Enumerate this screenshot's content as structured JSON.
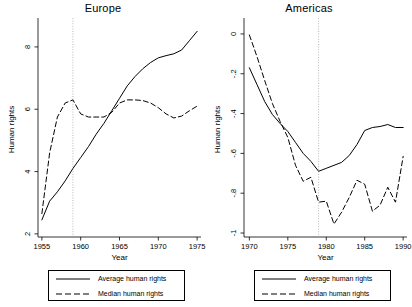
{
  "figure": {
    "axis_label_x": "Year",
    "axis_label_y": "Human rights"
  },
  "legend": {
    "average_label": "Average human rights",
    "median_label": "Median human rights",
    "average_style": "solid",
    "median_style": "dashed",
    "line_color": "#000000"
  },
  "chart_data": [
    {
      "type": "line",
      "title": "Europe",
      "xlabel": "Year",
      "ylabel": "Human rights",
      "xlim": [
        1954.5,
        1975.5
      ],
      "ylim": [
        1.9,
        8.8
      ],
      "xticks": [
        1955,
        1960,
        1965,
        1970,
        1975
      ],
      "xticklabels": [
        "1955",
        "1960",
        "1965",
        "1970",
        "1975"
      ],
      "yticks": [
        2,
        4,
        6,
        8
      ],
      "yticklabels": [
        "2",
        "4",
        "6",
        "8"
      ],
      "grid": false,
      "reference_line_x": 1959,
      "legend_position": "below",
      "x": [
        1955,
        1956,
        1957,
        1958,
        1959,
        1960,
        1961,
        1962,
        1963,
        1964,
        1965,
        1966,
        1967,
        1968,
        1969,
        1970,
        1971,
        1972,
        1973,
        1974,
        1975
      ],
      "series": [
        {
          "name": "Average human rights",
          "style": "solid",
          "values": [
            2.45,
            3.05,
            3.35,
            3.7,
            4.1,
            4.45,
            4.8,
            5.2,
            5.55,
            5.95,
            6.35,
            6.75,
            7.05,
            7.3,
            7.5,
            7.65,
            7.72,
            7.78,
            7.9,
            8.2,
            8.5
          ]
        },
        {
          "name": "Median human rights",
          "style": "dashed",
          "values": [
            2.65,
            4.6,
            5.75,
            6.2,
            6.3,
            5.85,
            5.75,
            5.75,
            5.75,
            5.9,
            6.2,
            6.3,
            6.3,
            6.28,
            6.2,
            6.05,
            5.85,
            5.72,
            5.78,
            5.95,
            6.1
          ]
        }
      ]
    },
    {
      "type": "line",
      "title": "Americas",
      "xlabel": "Year",
      "ylabel": "Human rights",
      "xlim": [
        1969.3,
        1990.5
      ],
      "ylim": [
        -1.02,
        0.06
      ],
      "xticks": [
        1970,
        1975,
        1980,
        1985,
        1990
      ],
      "xticklabels": [
        "1970",
        "1975",
        "1980",
        "1985",
        "1990"
      ],
      "yticks": [
        0,
        -0.2,
        -0.4,
        -0.6,
        -0.8,
        -1
      ],
      "yticklabels": [
        "0",
        "-.2",
        "-.4",
        "-.6",
        "-.8",
        "-1"
      ],
      "grid": false,
      "reference_line_x": 1979,
      "legend_position": "below",
      "x": [
        1970,
        1971,
        1972,
        1973,
        1974,
        1975,
        1976,
        1977,
        1978,
        1979,
        1980,
        1981,
        1982,
        1983,
        1984,
        1985,
        1986,
        1987,
        1988,
        1989,
        1990
      ],
      "series": [
        {
          "name": "Average human rights",
          "style": "solid",
          "values": [
            -0.17,
            -0.255,
            -0.34,
            -0.405,
            -0.45,
            -0.49,
            -0.545,
            -0.6,
            -0.64,
            -0.69,
            -0.675,
            -0.66,
            -0.645,
            -0.61,
            -0.555,
            -0.485,
            -0.47,
            -0.465,
            -0.455,
            -0.47,
            -0.47
          ]
        },
        {
          "name": "Median human rights",
          "style": "dashed",
          "values": [
            -0.005,
            -0.115,
            -0.235,
            -0.35,
            -0.44,
            -0.52,
            -0.66,
            -0.74,
            -0.72,
            -0.845,
            -0.84,
            -0.955,
            -0.895,
            -0.82,
            -0.735,
            -0.755,
            -0.89,
            -0.86,
            -0.77,
            -0.845,
            -0.615
          ]
        }
      ]
    }
  ]
}
